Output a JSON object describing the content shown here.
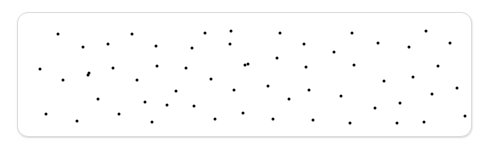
{
  "panel": {
    "name": "dot-pattern-panel",
    "shape": "rounded-rectangle",
    "background_color": "#ffffff",
    "border_color": "#dcdcdc",
    "border_radius_px": 11,
    "x": 17,
    "y": 12,
    "width": 455,
    "height": 125
  },
  "canvas": {
    "width": 485,
    "height": 148,
    "background_color": "#ffffff"
  },
  "chart_data": {
    "type": "scatter",
    "title": "",
    "xlabel": "",
    "ylabel": "",
    "grid": false,
    "legend": null,
    "xlim": [
      17,
      472
    ],
    "ylim": [
      12,
      137
    ],
    "marker": {
      "shape": "circle",
      "color": "#0a0a0a",
      "size_px": 3
    },
    "point_count": 60,
    "points": [
      {
        "x": 57,
        "y": 33
      },
      {
        "x": 82,
        "y": 46
      },
      {
        "x": 107,
        "y": 43
      },
      {
        "x": 131,
        "y": 33
      },
      {
        "x": 155,
        "y": 45
      },
      {
        "x": 39,
        "y": 68
      },
      {
        "x": 88,
        "y": 72
      },
      {
        "x": 112,
        "y": 67
      },
      {
        "x": 156,
        "y": 65
      },
      {
        "x": 62,
        "y": 79
      },
      {
        "x": 87,
        "y": 74
      },
      {
        "x": 136,
        "y": 79
      },
      {
        "x": 97,
        "y": 98
      },
      {
        "x": 144,
        "y": 101
      },
      {
        "x": 45,
        "y": 113
      },
      {
        "x": 76,
        "y": 120
      },
      {
        "x": 118,
        "y": 113
      },
      {
        "x": 151,
        "y": 121
      },
      {
        "x": 185,
        "y": 67
      },
      {
        "x": 191,
        "y": 47
      },
      {
        "x": 204,
        "y": 32
      },
      {
        "x": 229,
        "y": 43
      },
      {
        "x": 210,
        "y": 78
      },
      {
        "x": 175,
        "y": 90
      },
      {
        "x": 233,
        "y": 89
      },
      {
        "x": 193,
        "y": 105
      },
      {
        "x": 214,
        "y": 118
      },
      {
        "x": 242,
        "y": 112
      },
      {
        "x": 244,
        "y": 64
      },
      {
        "x": 247,
        "y": 63
      },
      {
        "x": 267,
        "y": 85
      },
      {
        "x": 276,
        "y": 57
      },
      {
        "x": 279,
        "y": 32
      },
      {
        "x": 288,
        "y": 98
      },
      {
        "x": 303,
        "y": 43
      },
      {
        "x": 305,
        "y": 66
      },
      {
        "x": 308,
        "y": 89
      },
      {
        "x": 272,
        "y": 118
      },
      {
        "x": 312,
        "y": 119
      },
      {
        "x": 333,
        "y": 51
      },
      {
        "x": 340,
        "y": 95
      },
      {
        "x": 349,
        "y": 122
      },
      {
        "x": 351,
        "y": 32
      },
      {
        "x": 353,
        "y": 64
      },
      {
        "x": 374,
        "y": 107
      },
      {
        "x": 377,
        "y": 42
      },
      {
        "x": 383,
        "y": 80
      },
      {
        "x": 399,
        "y": 102
      },
      {
        "x": 408,
        "y": 46
      },
      {
        "x": 412,
        "y": 76
      },
      {
        "x": 423,
        "y": 121
      },
      {
        "x": 425,
        "y": 30
      },
      {
        "x": 431,
        "y": 93
      },
      {
        "x": 437,
        "y": 65
      },
      {
        "x": 449,
        "y": 42
      },
      {
        "x": 456,
        "y": 87
      },
      {
        "x": 464,
        "y": 115
      },
      {
        "x": 166,
        "y": 104
      },
      {
        "x": 230,
        "y": 30
      },
      {
        "x": 396,
        "y": 122
      }
    ]
  }
}
